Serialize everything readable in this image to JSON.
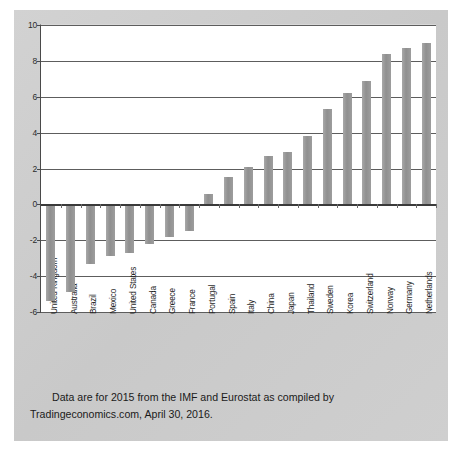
{
  "caption": {
    "line1": "Data are for 2015 from the IMF and Eurostat as compiled by",
    "line2": "Tradingeconomics.com, April 30, 2016."
  },
  "colors": {
    "bar": "#989898",
    "gridline": "#5d5d5d",
    "axis": "#3a3a3a",
    "mat": "#cdcdcd",
    "panel": "#ffffff",
    "text": "#1a1a1a"
  },
  "chart_data": {
    "type": "bar",
    "title": "",
    "subtitle": "",
    "xlabel": "",
    "ylabel": "",
    "ylim": [
      -6,
      10
    ],
    "yticks": [
      -6,
      -4,
      -2,
      0,
      2,
      4,
      6,
      8,
      10
    ],
    "ytick_labels": [
      "-6",
      "-4",
      "-2",
      "0",
      "2",
      "4",
      "6",
      "8",
      "10"
    ],
    "grid": true,
    "legend": "none",
    "orientation": "vertical",
    "sorted": "ascending",
    "categories": [
      "United Kingdom",
      "Australia",
      "Brazil",
      "Mexico",
      "United States",
      "Canada",
      "Greece",
      "France",
      "Portugal",
      "Spain",
      "Italy",
      "China",
      "Japan",
      "Thailand",
      "Sweden",
      "Korea",
      "Switzerland",
      "Norway",
      "Germany",
      "Netherlands"
    ],
    "values": [
      -5.4,
      -4.9,
      -3.3,
      -2.9,
      -2.7,
      -2.2,
      -1.8,
      -1.5,
      0.6,
      1.5,
      2.1,
      2.7,
      2.9,
      3.8,
      5.3,
      6.2,
      6.9,
      8.4,
      8.7,
      9.0
    ]
  }
}
